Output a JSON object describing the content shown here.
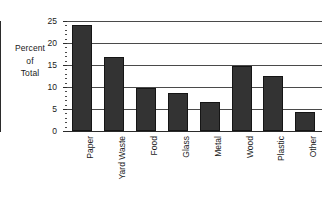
{
  "chart_data": {
    "type": "bar",
    "title": "",
    "subtitle": "",
    "xlabel": "",
    "ylabel": "Percent of Total",
    "ylabel_lines": [
      "Percent",
      "of",
      "Total"
    ],
    "categories": [
      "Paper",
      "Yard Waste",
      "Food",
      "Glass",
      "Metal",
      "Wood",
      "Plastic",
      "Other"
    ],
    "values": [
      24,
      16.9,
      9.8,
      8.7,
      6.6,
      14.8,
      12.5,
      4.3
    ],
    "ylim": [
      0,
      25
    ],
    "ytick_labels": [
      "0",
      "5",
      "10",
      "15",
      "20",
      "25"
    ],
    "ytick_values": [
      0,
      5,
      10,
      15,
      20,
      25
    ],
    "yminor_step": 1,
    "grid": "horizontal",
    "legend": "none",
    "bar_color": "#333333",
    "bar_edge_color": "#151515",
    "gridline_color": "#4a4a4a",
    "axis_color": "#2b2b2b",
    "background_color": "#ffffff",
    "xlabel_rotation": -90,
    "annotations": []
  }
}
